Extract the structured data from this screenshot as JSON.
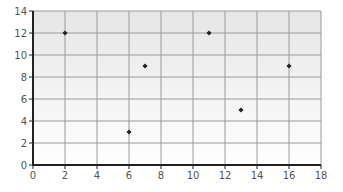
{
  "chart_data": {
    "type": "scatter",
    "title": "",
    "xlabel": "",
    "ylabel": "",
    "xlim": [
      0,
      18
    ],
    "ylim": [
      0,
      14
    ],
    "x_ticks": [
      0,
      2,
      4,
      6,
      8,
      10,
      12,
      14,
      16,
      18
    ],
    "y_ticks": [
      0,
      2,
      4,
      6,
      8,
      10,
      12,
      14
    ],
    "grid": true,
    "legend": null,
    "series": [
      {
        "name": "",
        "marker": "diamond",
        "color": "#222222",
        "points": [
          {
            "x": 2,
            "y": 12
          },
          {
            "x": 6,
            "y": 3
          },
          {
            "x": 7,
            "y": 9
          },
          {
            "x": 11,
            "y": 12
          },
          {
            "x": 13,
            "y": 5
          },
          {
            "x": 16,
            "y": 9
          }
        ]
      }
    ]
  },
  "style": {
    "plot_bg_top": "#e6e6e6",
    "plot_bg_bottom": "#ffffff",
    "grid_color": "#9a9a9a",
    "axis_color": "#222222",
    "tick_label_color": "#555555",
    "marker_color": "#222222"
  }
}
